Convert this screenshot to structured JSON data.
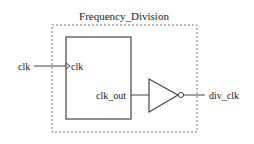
{
  "diagram": {
    "module": {
      "title": "Frequency_Division",
      "border_style": "dashed"
    },
    "block": {
      "input_port_label": "clk",
      "output_port_label": "clk_out",
      "input_marker": "clock-edge-triangle"
    },
    "gate": {
      "type": "NOT",
      "symbol": "inverter-with-bubble"
    },
    "external_input": {
      "label": "clk"
    },
    "external_output": {
      "label": "div_clk"
    },
    "colors": {
      "line": "#444444",
      "dashed_border": "#777777",
      "text": "#222222",
      "background": "#ffffff"
    }
  }
}
